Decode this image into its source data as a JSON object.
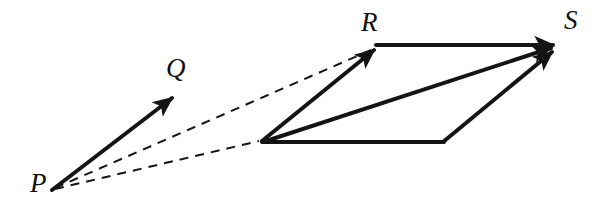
{
  "figure": {
    "kind": "vector-parallelogram-diagram",
    "width": 615,
    "height": 207,
    "background_color": "#ffffff",
    "stroke_color": "#141414",
    "label_color": "#111111",
    "solid_stroke_width": 4.0,
    "dashed_stroke_width": 2.0,
    "dash_pattern": "9 7"
  },
  "labels": {
    "p": "P",
    "q": "Q",
    "r": "R",
    "s": "S"
  },
  "label_positions": {
    "p": {
      "x": 30,
      "y": 172,
      "size": 27
    },
    "q": {
      "x": 166,
      "y": 56,
      "size": 27
    },
    "r": {
      "x": 360,
      "y": 10,
      "size": 27
    },
    "s": {
      "x": 563,
      "y": 8,
      "size": 27
    }
  },
  "points": {
    "P": {
      "x": 52,
      "y": 190
    },
    "Q": {
      "x": 174,
      "y": 97
    },
    "O": {
      "x": 262,
      "y": 141
    },
    "R": {
      "x": 376,
      "y": 48
    },
    "B": {
      "x": 443,
      "y": 142
    },
    "S": {
      "x": 557,
      "y": 45
    }
  },
  "vectors": [
    {
      "name": "vector-PQ",
      "from": "P",
      "to": "Q",
      "style": "solid",
      "arrowhead": true
    },
    {
      "name": "vector-OR",
      "from": "O",
      "to": "R",
      "style": "solid",
      "arrowhead": true
    },
    {
      "name": "vector-RS",
      "from": "R",
      "to": "S",
      "style": "solid",
      "arrowhead": true
    },
    {
      "name": "vector-OS",
      "from": "O",
      "to": "S",
      "style": "solid",
      "arrowhead": true
    },
    {
      "name": "vector-BS",
      "from": "B",
      "to": "S",
      "style": "solid",
      "arrowhead": true
    },
    {
      "name": "edge-OB",
      "from": "O",
      "to": "B",
      "style": "solid",
      "arrowhead": false
    }
  ],
  "dashed_lines": [
    {
      "name": "translation-line-P-to-R",
      "from": "P",
      "to": "R"
    },
    {
      "name": "translation-line-P-to-O",
      "from": "P",
      "to": "O"
    }
  ]
}
